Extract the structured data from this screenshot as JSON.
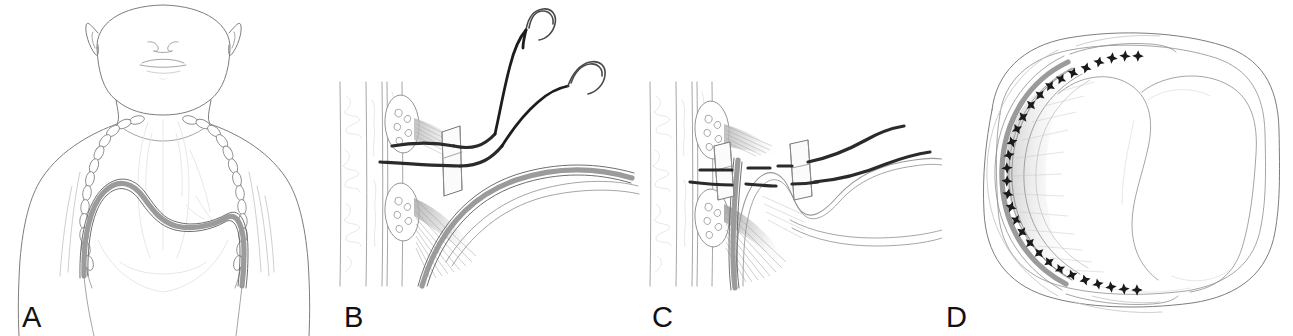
{
  "figure": {
    "kind": "medical-surgical-illustration",
    "background_color": "#ffffff",
    "width": 1293,
    "height": 336,
    "style": "pen-and-ink line drawing, grayscale",
    "caption_labels": [
      "A",
      "B",
      "C",
      "D"
    ],
    "panel_count": 4
  },
  "panels": [
    {
      "id": "A",
      "label": "A",
      "title": "Anterior view of infant chest with elevated hemidiaphragm",
      "view": "anterior / frontal",
      "elements": [
        "infant-head",
        "ear-left",
        "ear-right",
        "nose",
        "mouth",
        "chin-contour",
        "neck",
        "shoulder-left",
        "shoulder-right",
        "torso-outline",
        "costal-margin-left",
        "costal-margin-right",
        "rib-chain-left",
        "rib-chain-right",
        "mediastinum",
        "lung-field-left",
        "lung-field-right",
        "diaphragm-band"
      ],
      "accent_structure": "diaphragm-band",
      "accent_color": "#9b9b9b"
    },
    {
      "id": "B",
      "label": "B",
      "title": "Suture placement around rib with pledget, needles passed",
      "view": "lateral close-up of chest wall / intercostal space",
      "elements": [
        "chest-wall-layers",
        "rib-cross-section-upper",
        "rib-cross-section-lower",
        "rib-marrow-stipple",
        "intercostal-muscle-hatching",
        "pledget-plate",
        "suture-strand-upper",
        "suture-strand-lower",
        "curved-needle-upper",
        "curved-needle-lower",
        "diaphragm-band"
      ],
      "needle_count": 2,
      "pledget_count": 1
    },
    {
      "id": "C",
      "label": "C",
      "title": "Sutures passed through diaphragm and tied over two pledgets",
      "view": "lateral close-up of chest wall / intercostal space",
      "elements": [
        "chest-wall-layers",
        "rib-cross-section-upper",
        "rib-cross-section-lower",
        "rib-marrow-stipple",
        "intercostal-muscle-hatching",
        "pledget-plate-medial",
        "pledget-plate-lateral",
        "suture-strand-upper",
        "suture-strand-lower",
        "plicated-diaphragm-fold",
        "diaphragm-band"
      ],
      "needle_count": 0,
      "pledget_count": 2
    },
    {
      "id": "D",
      "label": "D",
      "title": "Axial cross-section showing completed row of suture knots along chest wall",
      "view": "axial / transverse cross-section",
      "elements": [
        "body-wall-outline",
        "chest-cavity",
        "lung-right",
        "lung-left",
        "mediastinum-divider",
        "plicated-diaphragm-arc",
        "suture-knot-row",
        "muscle-striation-shading"
      ],
      "knot_count": 30,
      "knot_glyph": "star-knot",
      "knot_color": "#1a1a1a"
    }
  ],
  "colors": {
    "background": "#ffffff",
    "hairline": "#8e8e8e",
    "faint_line": "#c3c3c3",
    "body_outline": "#7d7d7d",
    "suture_black": "#1d1d1d",
    "needle_steel": "#4a4a4a",
    "diaphragm_gray": "#9b9b9b",
    "label_text": "#111111"
  },
  "labels": {
    "a": "A",
    "b": "B",
    "c": "C",
    "d": "D"
  }
}
